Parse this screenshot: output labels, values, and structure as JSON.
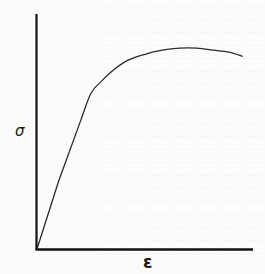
{
  "chart_data": {
    "type": "line",
    "title": "",
    "xlabel": "ε",
    "ylabel": "σ",
    "grid": false,
    "legend": null,
    "x_ticks": [],
    "y_ticks": [],
    "xlim": [
      0,
      1
    ],
    "ylim": [
      0,
      1
    ],
    "series": [
      {
        "name": "stress-strain",
        "x": [
          0.0,
          0.1,
          0.2,
          0.25,
          0.3,
          0.35,
          0.42,
          0.5,
          0.58,
          0.66,
          0.74,
          0.82,
          0.89,
          0.95
        ],
        "y": [
          0.0,
          0.33,
          0.62,
          0.76,
          0.82,
          0.87,
          0.92,
          0.95,
          0.97,
          0.98,
          0.98,
          0.97,
          0.96,
          0.94
        ]
      }
    ],
    "colors": {
      "curve": "#2a2a2a",
      "axes": "#111111"
    }
  },
  "axes": {
    "y_symbol": "σ",
    "x_symbol": "ε"
  }
}
